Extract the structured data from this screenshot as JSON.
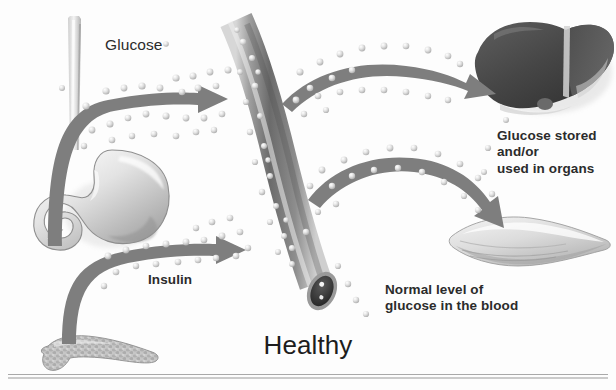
{
  "figure": {
    "title": "Healthy",
    "background_color": "#fdfdfd",
    "ink_color": "#2b2b2b",
    "arrow_color": "#7e7e7e",
    "vessel_color": "#6f6f6f",
    "liver_color": "#4a4a4a",
    "glucose_dot_color": "#d9d9d9"
  },
  "labels": {
    "glucose": "Glucose",
    "insulin": "Insulin",
    "glucose_stored": "Glucose stored\nand/or\nused in organs",
    "normal_level": "Normal level of\nglucose in the blood"
  },
  "organs": [
    {
      "name": "esophagus",
      "label": ""
    },
    {
      "name": "stomach",
      "label": ""
    },
    {
      "name": "pancreas",
      "label": ""
    },
    {
      "name": "blood-vessel",
      "label": ""
    },
    {
      "name": "liver",
      "label": ""
    },
    {
      "name": "muscle",
      "label": ""
    }
  ],
  "arrows": [
    {
      "name": "glucose-arrow",
      "from": "stomach",
      "to": "blood-vessel"
    },
    {
      "name": "insulin-arrow",
      "from": "pancreas",
      "to": "blood-vessel"
    },
    {
      "name": "liver-arrow",
      "from": "blood-vessel",
      "to": "liver"
    },
    {
      "name": "muscle-arrow",
      "from": "blood-vessel",
      "to": "muscle"
    }
  ]
}
